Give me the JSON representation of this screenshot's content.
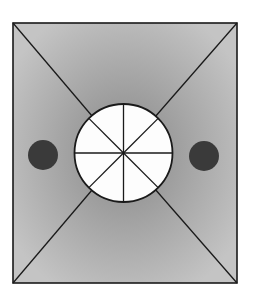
{
  "diagram": {
    "type": "geometric-figure",
    "width": 253,
    "height": 306,
    "colors": {
      "background": "#ffffff",
      "outline": "#1a1a1a",
      "gradient_center": "#888888",
      "gradient_edge": "#c4c4c4",
      "circle_fill": "#fdfdfd",
      "dot_fill": "#3a3a3a"
    },
    "rectangle": {
      "x": 13,
      "y": 23,
      "width": 224,
      "height": 260
    },
    "center_circle": {
      "cx": 123.5,
      "cy": 153,
      "r": 49,
      "segments": 8
    },
    "dots": [
      {
        "name": "left-dot",
        "cx": 43,
        "cy": 155,
        "r": 15
      },
      {
        "name": "right-dot",
        "cx": 204,
        "cy": 156,
        "r": 15
      }
    ]
  }
}
